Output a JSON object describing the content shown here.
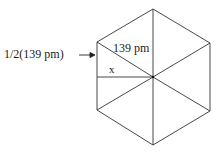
{
  "diagram": {
    "type": "hexagon-geometry",
    "labels": {
      "half_side": "1/2(139 pm)",
      "side": "139 pm",
      "apothem": "x"
    },
    "arrow": "→",
    "colors": {
      "line": "#333333",
      "text": "#222222",
      "background": "#ffffff"
    }
  }
}
